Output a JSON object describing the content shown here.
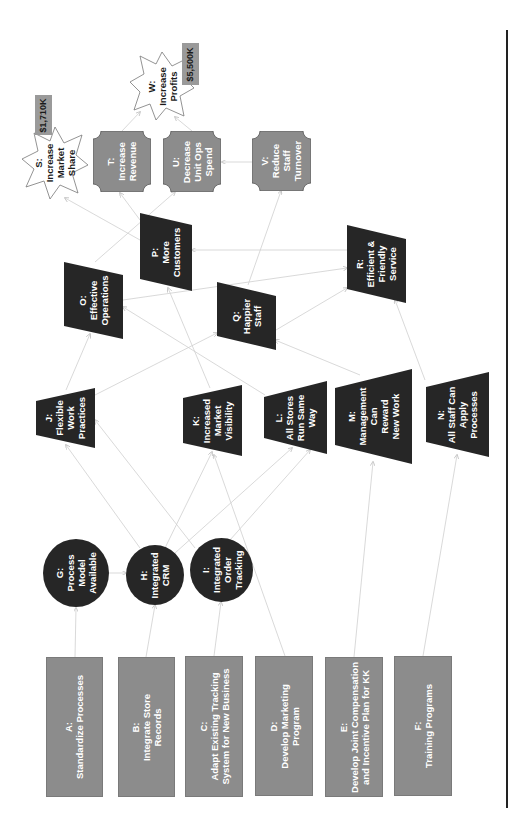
{
  "diagram": {
    "orientation": "rotated-90-ccw",
    "colors": {
      "action_box": "#8c8c8c",
      "intermediate_dark": "#262626",
      "outcome_octagon": "#8c8c8c",
      "goal_star_fill": "#ffffff",
      "value_tag": "#9a9a9a",
      "edge": "#c8c8c8",
      "frame_line": "#222222"
    },
    "actions": [
      {
        "id": "A",
        "label": "A:\nStandardize Processes"
      },
      {
        "id": "B",
        "label": "B:\nIntegrate Store\nRecords"
      },
      {
        "id": "C",
        "label": "C:\nAdapt Existing Tracking\nSystem for New Business"
      },
      {
        "id": "D",
        "label": "D:\nDevelop Marketing\nProgram"
      },
      {
        "id": "E",
        "label": "E:\nDevelop Joint Compensation\nand Incentive Plan for KK"
      },
      {
        "id": "F",
        "label": "F:\nTraining Programs"
      }
    ],
    "capabilities": [
      {
        "id": "G",
        "label": "G:\nProcess\nModel\nAvailable"
      },
      {
        "id": "H",
        "label": "H:\nIntegrated\nCRM"
      },
      {
        "id": "I",
        "label": "I:\nIntegrated\nOrder\nTracking"
      }
    ],
    "practices": [
      {
        "id": "J",
        "label": "J:\nFlexible\nWork\nPractices"
      },
      {
        "id": "K",
        "label": "K:\nIncreased\nMarket\nVisibility"
      },
      {
        "id": "L",
        "label": "L:\nAll Stores\nRun Same\nWay"
      },
      {
        "id": "M",
        "label": "M:\nManagement\nCan\nReward\nNew Work"
      },
      {
        "id": "N",
        "label": "N:\nAll Staff Can\nApply\nProcesses"
      }
    ],
    "effects": [
      {
        "id": "O",
        "label": "O:\nEffective\nOperations"
      },
      {
        "id": "P",
        "label": "P:\nMore\nCustomers"
      },
      {
        "id": "Q",
        "label": "Q:\nHappier\nStaff"
      },
      {
        "id": "R",
        "label": "R:\nEfficient &\nFriendly\nService"
      }
    ],
    "outcomes": [
      {
        "id": "T",
        "label": "T:\nIncrease\nRevenue"
      },
      {
        "id": "U",
        "label": "U:\nDecrease\nUnit Ops\nSpend"
      },
      {
        "id": "V",
        "label": "V:\nReduce\nStaff\nTurnover"
      }
    ],
    "goals": [
      {
        "id": "S",
        "label": "S:\nIncrease\nMarket\nShare",
        "value": "$1,710K"
      },
      {
        "id": "W",
        "label": "W:\nIncrease\nProfits",
        "value": "$5,500K"
      }
    ],
    "edges": [
      [
        "A",
        "G"
      ],
      [
        "B",
        "H"
      ],
      [
        "C",
        "I"
      ],
      [
        "G",
        "H"
      ],
      [
        "H",
        "J"
      ],
      [
        "H",
        "K"
      ],
      [
        "H",
        "L"
      ],
      [
        "I",
        "L"
      ],
      [
        "D",
        "K"
      ],
      [
        "J",
        "O"
      ],
      [
        "J",
        "Q"
      ],
      [
        "D",
        "J"
      ],
      [
        "E",
        "M"
      ],
      [
        "F",
        "N"
      ],
      [
        "K",
        "P"
      ],
      [
        "L",
        "O"
      ],
      [
        "M",
        "Q"
      ],
      [
        "N",
        "R"
      ],
      [
        "O",
        "R"
      ],
      [
        "O",
        "U"
      ],
      [
        "Q",
        "R"
      ],
      [
        "Q",
        "V"
      ],
      [
        "R",
        "P"
      ],
      [
        "P",
        "S"
      ],
      [
        "P",
        "T"
      ],
      [
        "V",
        "U"
      ],
      [
        "T",
        "W"
      ],
      [
        "U",
        "W"
      ]
    ]
  }
}
